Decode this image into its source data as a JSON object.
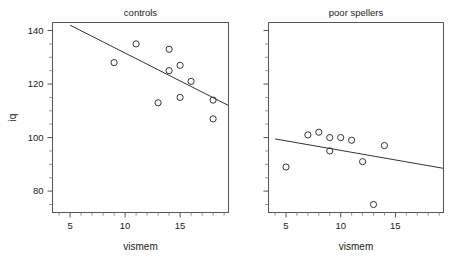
{
  "figure": {
    "xlabel": "vismem",
    "ylabel": "iq",
    "panel_titles": [
      "controls",
      "poor spellers"
    ],
    "x_ticks": [
      "5",
      "10",
      "15"
    ],
    "y_ticks": [
      "140",
      "120",
      "100",
      "80"
    ],
    "line_color": "#333333",
    "point_color": "#333333",
    "frame_color": "#555555"
  },
  "chart_data": {
    "type": "scatter",
    "title": "",
    "xlabel": "vismem",
    "ylabel": "iq",
    "xlim": [
      3.4,
      19.4
    ],
    "ylim": [
      72,
      143
    ],
    "x_ticks": [
      5,
      10,
      15
    ],
    "y_ticks": [
      80,
      100,
      120,
      140
    ],
    "grid": false,
    "legend": "none",
    "panels": [
      {
        "title": "controls",
        "x": [
          9,
          11,
          13,
          14,
          14,
          15,
          15,
          16,
          18,
          18
        ],
        "y": [
          128,
          135,
          113,
          133,
          125,
          127,
          115,
          121,
          114,
          107
        ],
        "fit_line": {
          "x": [
            5,
            19.4
          ],
          "y": [
            142,
            112
          ]
        }
      },
      {
        "title": "poor spellers",
        "x": [
          5,
          7,
          8,
          9,
          9,
          10,
          11,
          12,
          13,
          14
        ],
        "y": [
          89,
          101,
          102,
          100,
          95,
          100,
          99,
          91,
          75,
          97
        ],
        "fit_line": {
          "x": [
            4.0,
            19.4
          ],
          "y": [
            99.5,
            88.5
          ]
        }
      }
    ]
  }
}
